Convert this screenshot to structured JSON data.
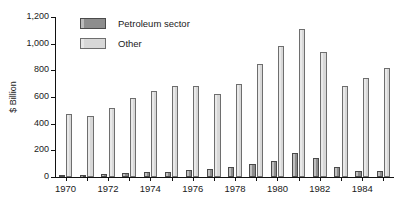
{
  "chart_data": {
    "type": "bar",
    "title": "",
    "subtitle": "",
    "xlabel": "",
    "ylabel": "$ Billion",
    "ylim": [
      0,
      1200
    ],
    "yticks": [
      0,
      200,
      400,
      600,
      800,
      1000,
      1200
    ],
    "ytick_labels": [
      "0",
      "200",
      "400",
      "600",
      "800",
      "1,000",
      "1,200"
    ],
    "grid": false,
    "legend_position": "top-left",
    "categories": [
      "1970",
      "1971",
      "1972",
      "1973",
      "1974",
      "1975",
      "1976",
      "1977",
      "1978",
      "1979",
      "1980",
      "1981",
      "1982",
      "1983",
      "1984",
      "1985"
    ],
    "xtick_labels": [
      "1970",
      "1972",
      "1974",
      "1976",
      "1978",
      "1980",
      "1982",
      "1984"
    ],
    "series": [
      {
        "name": "Petroleum sector",
        "color": "#8d8d8d",
        "values": [
          15,
          18,
          22,
          28,
          35,
          40,
          50,
          62,
          78,
          95,
          120,
          180,
          145,
          75,
          45,
          48
        ]
      },
      {
        "name": "Other",
        "color": "#d8d8d8",
        "values": [
          470,
          460,
          520,
          595,
          645,
          680,
          685,
          625,
          695,
          845,
          985,
          1110,
          935,
          685,
          745,
          815
        ]
      }
    ]
  },
  "legend": {
    "items": [
      {
        "label": "Petroleum sector",
        "swatch": "petroleum-swatch"
      },
      {
        "label": "Other",
        "swatch": "other-swatch"
      }
    ]
  },
  "axes": {
    "y_title": "$ Billion"
  }
}
